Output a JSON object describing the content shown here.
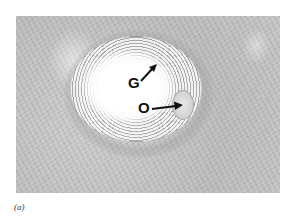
{
  "figure": {
    "caption": "(a)",
    "labels": {
      "G": "G",
      "O": "O"
    },
    "colors": {
      "tissue": "#c6c6c6",
      "antrum": "#ffffff",
      "label": "#111111"
    }
  }
}
